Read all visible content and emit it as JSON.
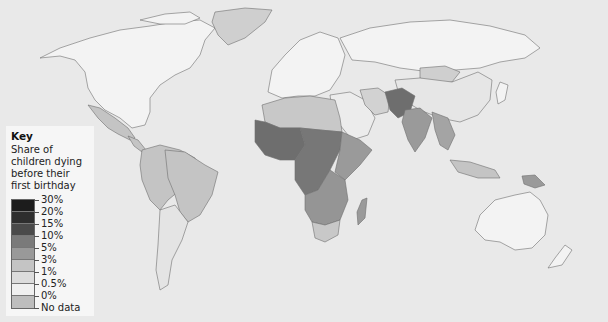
{
  "key": {
    "title": "Key",
    "description": "Share of children dying before their first birthday",
    "categories": [
      {
        "label": "30%",
        "color": "#1c1c1c"
      },
      {
        "label": "20%",
        "color": "#2e2e2e"
      },
      {
        "label": "15%",
        "color": "#4a4a4a"
      },
      {
        "label": "10%",
        "color": "#7a7a7a"
      },
      {
        "label": "5%",
        "color": "#999999"
      },
      {
        "label": "3%",
        "color": "#c4c4c4"
      },
      {
        "label": "1%",
        "color": "#dcdcdc"
      },
      {
        "label": "0.5%",
        "color": "#f0f0f0"
      },
      {
        "label": "0%",
        "color": "#bdbdbd"
      },
      {
        "label": "No data",
        "color": ""
      }
    ]
  },
  "map": {
    "title": "World map: share of children dying before their first birthday",
    "regions": [
      {
        "name": "North America",
        "category": "0.5%"
      },
      {
        "name": "Greenland",
        "category": "No data"
      },
      {
        "name": "Mexico",
        "category": "3%"
      },
      {
        "name": "Central America",
        "category": "3%"
      },
      {
        "name": "Northern South America",
        "category": "3%"
      },
      {
        "name": "Brazil",
        "category": "3%"
      },
      {
        "name": "Southern Cone",
        "category": "1%"
      },
      {
        "name": "Europe",
        "category": "0.5%"
      },
      {
        "name": "Russia",
        "category": "0.5%"
      },
      {
        "name": "North Africa",
        "category": "3%"
      },
      {
        "name": "West Africa",
        "category": "10%"
      },
      {
        "name": "Central Africa",
        "category": "10%"
      },
      {
        "name": "East Africa",
        "category": "5%"
      },
      {
        "name": "Southern Africa",
        "category": "5%"
      },
      {
        "name": "South Africa",
        "category": "3%"
      },
      {
        "name": "Madagascar",
        "category": "5%"
      },
      {
        "name": "Middle East",
        "category": "1%"
      },
      {
        "name": "Iran",
        "category": "3%"
      },
      {
        "name": "Pakistan / Afghanistan",
        "category": "10%"
      },
      {
        "name": "India",
        "category": "5%"
      },
      {
        "name": "Mongolia",
        "category": "3%"
      },
      {
        "name": "China",
        "category": "1%"
      },
      {
        "name": "Southeast Asia",
        "category": "5%"
      },
      {
        "name": "Indonesia",
        "category": "3%"
      },
      {
        "name": "Papua New Guinea",
        "category": "5%"
      },
      {
        "name": "Australia",
        "category": "0.5%"
      },
      {
        "name": "New Zealand",
        "category": "0.5%"
      }
    ]
  }
}
